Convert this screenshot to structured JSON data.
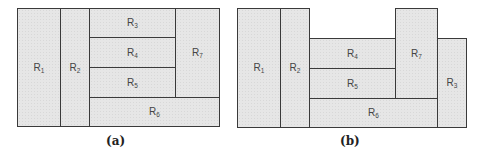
{
  "panels": [
    {
      "caption": "(a)",
      "regions": [
        {
          "id": "R1",
          "base": "R",
          "sub": "1"
        },
        {
          "id": "R2",
          "base": "R",
          "sub": "2"
        },
        {
          "id": "R3",
          "base": "R",
          "sub": "3"
        },
        {
          "id": "R4",
          "base": "R",
          "sub": "4"
        },
        {
          "id": "R5",
          "base": "R",
          "sub": "5"
        },
        {
          "id": "R6",
          "base": "R",
          "sub": "6"
        },
        {
          "id": "R7",
          "base": "R",
          "sub": "7"
        }
      ]
    },
    {
      "caption": "(b)",
      "regions": [
        {
          "id": "R1",
          "base": "R",
          "sub": "1"
        },
        {
          "id": "R2",
          "base": "R",
          "sub": "2"
        },
        {
          "id": "R4",
          "base": "R",
          "sub": "4"
        },
        {
          "id": "R5",
          "base": "R",
          "sub": "5"
        },
        {
          "id": "R6",
          "base": "R",
          "sub": "6"
        },
        {
          "id": "R7",
          "base": "R",
          "sub": "7"
        },
        {
          "id": "R3",
          "base": "R",
          "sub": "3"
        }
      ]
    }
  ],
  "colors": {
    "fill": "#e6e6e6",
    "stroke": "#3a3a3a"
  }
}
